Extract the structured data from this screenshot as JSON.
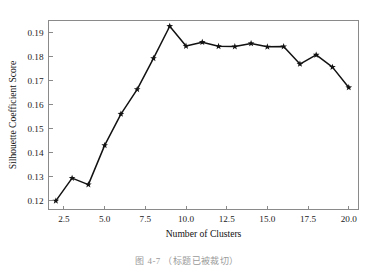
{
  "figure": {
    "caption": "图 4-7  （标题已被裁切）"
  },
  "chart_data": {
    "type": "line",
    "title": "",
    "subtitle": "",
    "xlabel": "Number of Clusters",
    "ylabel": "Silhouette Coefficient Score",
    "xlim": [
      1.55,
      20.6
    ],
    "ylim": [
      0.1162,
      0.1952
    ],
    "grid": false,
    "legend": null,
    "legend_position": "none",
    "marker": "star",
    "line_color": "#121212",
    "marker_color": "#121212",
    "frame_color": "#8a8a8a",
    "background_color": "#ffffff",
    "xticks": [
      2.5,
      5.0,
      7.5,
      10.0,
      12.5,
      15.0,
      17.5,
      20.0
    ],
    "xtick_labels": [
      "2.5",
      "5.0",
      "7.5",
      "10.0",
      "12.5",
      "15.0",
      "17.5",
      "20.0"
    ],
    "yticks": [
      0.12,
      0.13,
      0.14,
      0.15,
      0.16,
      0.17,
      0.18,
      0.19
    ],
    "ytick_labels": [
      "0.12",
      "0.13",
      "0.14",
      "0.15",
      "0.16",
      "0.17",
      "0.18",
      "0.19"
    ],
    "x": [
      2,
      3,
      4,
      5,
      6,
      7,
      8,
      9,
      10,
      11,
      12,
      13,
      14,
      15,
      16,
      17,
      18,
      19,
      20
    ],
    "values": [
      0.1198,
      0.1293,
      0.1266,
      0.143,
      0.1561,
      0.1664,
      0.1794,
      0.1928,
      0.1845,
      0.1861,
      0.1844,
      0.1843,
      0.1856,
      0.1842,
      0.1843,
      0.177,
      0.1808,
      0.1757,
      0.1672
    ],
    "series": [
      {
        "name": "Silhouette Coefficient Score",
        "values": [
          0.1198,
          0.1293,
          0.1266,
          0.143,
          0.1561,
          0.1664,
          0.1794,
          0.1928,
          0.1845,
          0.1861,
          0.1844,
          0.1843,
          0.1856,
          0.1842,
          0.1843,
          0.177,
          0.1808,
          0.1757,
          0.1672
        ]
      }
    ],
    "annotations": []
  }
}
